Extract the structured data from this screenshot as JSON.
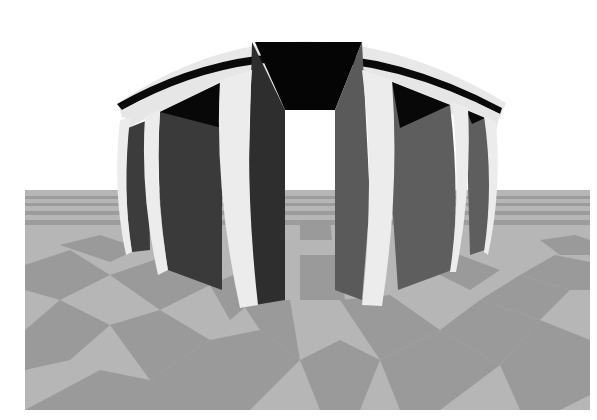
{
  "scene": {
    "description": "Fisheye-distorted 3D render of a round colonnade structure with a dark roof band, standing on a gray checkerboard floor",
    "width": 597,
    "height": 420,
    "colors": {
      "background": "#ffffff",
      "floor_light": "#bcbcbc",
      "floor_dark": "#9a9a9a",
      "column": "#ececec",
      "wall_dark": "#3a3a3a",
      "wall_mid": "#5e5e5e",
      "roof_band": "#0a0a0a",
      "roof_rim": "#e6e6e6",
      "doorway": "#ffffff"
    },
    "elements": {
      "floor": "checkerboard-floor",
      "structure": "domed-colonnade",
      "columns_count": 6,
      "doorway": "central-opening"
    }
  }
}
